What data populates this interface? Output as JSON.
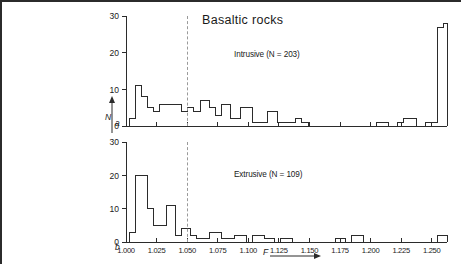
{
  "figure": {
    "title": "Basaltic rocks",
    "panel_a_mark": "a",
    "panel_b_mark": "b",
    "xaxis_title": "F",
    "yaxis_title": "N"
  },
  "chart_data": [
    {
      "type": "bar",
      "title": "Basaltic rocks",
      "series_label": "Intrusive (N = 203)",
      "panel": "a",
      "xlabel": "F",
      "ylabel": "N",
      "xlim": [
        1.0,
        1.2625
      ],
      "ylim": [
        0,
        30
      ],
      "yticks": [
        0,
        10,
        20,
        30
      ],
      "xticks": [
        1.0,
        1.025,
        1.05,
        1.075,
        1.1,
        1.125,
        1.15,
        1.175,
        1.2,
        1.225,
        1.25
      ],
      "xticklabels": [
        "1.000",
        "1.025",
        "1.050",
        "1.075",
        "1.100",
        "1.125",
        "1.150",
        "1.175",
        "1.200",
        "1.225",
        "1.250"
      ],
      "bin_width": 0.0025,
      "bin_starts": [
        1.0,
        1.0025,
        1.005,
        1.0075,
        1.01,
        1.0125,
        1.015,
        1.0175,
        1.02,
        1.0225,
        1.025,
        1.0275,
        1.03,
        1.0325,
        1.035,
        1.0375,
        1.04,
        1.0425,
        1.045,
        1.0475,
        1.05,
        1.0525,
        1.055,
        1.0575,
        1.06,
        1.0625,
        1.065,
        1.0675,
        1.07,
        1.0725,
        1.075,
        1.0775,
        1.08,
        1.0825,
        1.085,
        1.0875,
        1.09,
        1.0925,
        1.095,
        1.0975,
        1.1,
        1.1025,
        1.105,
        1.1075,
        1.11,
        1.1125,
        1.115,
        1.1175,
        1.12,
        1.1225,
        1.125,
        1.1275,
        1.13,
        1.1325,
        1.135,
        1.1375,
        1.14,
        1.1425,
        1.145,
        1.1475,
        1.15,
        1.1525,
        1.155,
        1.1575,
        1.16,
        1.1625,
        1.165,
        1.1675,
        1.17,
        1.1725,
        1.175,
        1.1775,
        1.18,
        1.1825,
        1.185,
        1.1875,
        1.19,
        1.1925,
        1.195,
        1.1975,
        1.2,
        1.2025,
        1.205,
        1.2075,
        1.21,
        1.2125,
        1.215,
        1.2175,
        1.22,
        1.2225,
        1.225,
        1.2275,
        1.23,
        1.2325,
        1.235,
        1.2375,
        1.24,
        1.2425,
        1.245,
        1.2475,
        1.25,
        1.2525,
        1.255,
        1.2575
      ],
      "values": [
        0,
        2,
        2,
        11,
        11,
        8,
        8,
        5,
        5,
        4,
        4,
        6,
        6,
        6,
        6,
        6,
        6,
        6,
        4,
        4,
        5,
        5,
        4,
        4,
        7,
        7,
        7,
        5,
        5,
        3,
        3,
        6,
        6,
        6,
        2,
        2,
        2,
        5,
        5,
        5,
        5,
        1,
        1,
        1,
        1,
        1,
        4,
        4,
        4,
        1,
        1,
        1,
        1,
        1,
        1,
        2,
        2,
        1,
        1,
        0,
        0,
        0,
        0,
        0,
        0,
        0,
        0,
        0,
        0,
        0,
        0,
        0,
        0,
        0,
        0,
        0,
        0,
        0,
        0,
        0,
        0,
        1,
        1,
        1,
        1,
        0,
        0,
        0,
        1,
        1,
        2,
        2,
        2,
        2,
        0,
        0,
        0,
        1,
        1,
        1,
        1,
        27,
        27,
        28
      ],
      "overflow_bin": {
        "label": "≥ 1.250",
        "value": 28
      },
      "marker_line": {
        "x": 1.0405,
        "style": "dashed",
        "color": "#9a9a9a"
      }
    },
    {
      "type": "bar",
      "series_label": "Extrusive (N = 109)",
      "panel": "b",
      "xlabel": "F",
      "ylabel": "N",
      "xlim": [
        1.0,
        1.2625
      ],
      "ylim": [
        0,
        30
      ],
      "yticks": [
        0,
        10,
        20,
        30
      ],
      "xticks": [
        1.0,
        1.025,
        1.05,
        1.075,
        1.1,
        1.125,
        1.15,
        1.175,
        1.2,
        1.225,
        1.25
      ],
      "xticklabels": [
        "1.000",
        "1.025",
        "1.050",
        "1.075",
        "1.100",
        "1.125",
        "1.150",
        "1.175",
        "1.200",
        "1.225",
        "1.250"
      ],
      "bin_width": 0.0025,
      "values": [
        0,
        3,
        3,
        20,
        20,
        20,
        20,
        10,
        10,
        5,
        5,
        5,
        5,
        11,
        11,
        11,
        2,
        2,
        4,
        4,
        4,
        2,
        2,
        1,
        1,
        1,
        1,
        3,
        3,
        3,
        3,
        1,
        1,
        1,
        1,
        2,
        2,
        2,
        2,
        0,
        0,
        2,
        2,
        2,
        2,
        1,
        1,
        1,
        0,
        0,
        1,
        1,
        1,
        1,
        0,
        0,
        0,
        0,
        0,
        0,
        0,
        0,
        0,
        0,
        0,
        0,
        0,
        0,
        1,
        1,
        1,
        0,
        0,
        2,
        2,
        2,
        2,
        0,
        0,
        0,
        0,
        0,
        0,
        0,
        0,
        0,
        0,
        0,
        0,
        0,
        0,
        0,
        0,
        0,
        0,
        0,
        0,
        0,
        0,
        0,
        0,
        2,
        2,
        2
      ],
      "overflow_bin": {
        "label": "≥ 1.250",
        "value": 2
      },
      "marker_line": {
        "x": 1.0405,
        "style": "dashed",
        "color": "#9a9a9a"
      }
    }
  ]
}
